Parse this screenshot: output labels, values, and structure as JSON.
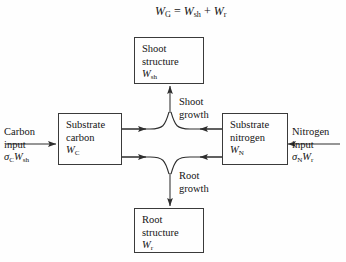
{
  "figure": {
    "equation": {
      "text": "W_G = W_sh + W_r",
      "lhs_var": "W",
      "lhs_sub": "G",
      "operator_eq": "=",
      "term1_var": "W",
      "term1_sub": "sh",
      "operator_plus": "+",
      "term2_var": "W",
      "term2_sub": "r"
    },
    "boxes": {
      "shoot_structure": {
        "line1": "Shoot",
        "line2": "structure",
        "var": "W",
        "sub": "sh"
      },
      "substrate_carbon": {
        "line1": "Substrate",
        "line2": "carbon",
        "var": "W",
        "sub": "C"
      },
      "substrate_nitrogen": {
        "line1": "Substrate",
        "line2": "nitrogen",
        "var": "W",
        "sub": "N"
      },
      "root_structure": {
        "line1": "Root",
        "line2": "structure",
        "var": "W",
        "sub": "r"
      }
    },
    "labels": {
      "carbon_input": {
        "line1": "Carbon",
        "line2": "input",
        "sigma": "σ",
        "sigma_sub": "C",
        "var": "W",
        "var_sub": "sh"
      },
      "nitrogen_input": {
        "line1": "Nitrogen",
        "line2": "input",
        "sigma": "σ",
        "sigma_sub": "N",
        "var": "W",
        "var_sub": "r"
      },
      "shoot_growth": {
        "line1": "Shoot",
        "line2": "growth"
      },
      "root_growth": {
        "line1": "Root",
        "line2": "growth"
      }
    },
    "colors": {
      "background": "#fefefe",
      "stroke": "#3a3a3a",
      "text": "#141414"
    }
  }
}
